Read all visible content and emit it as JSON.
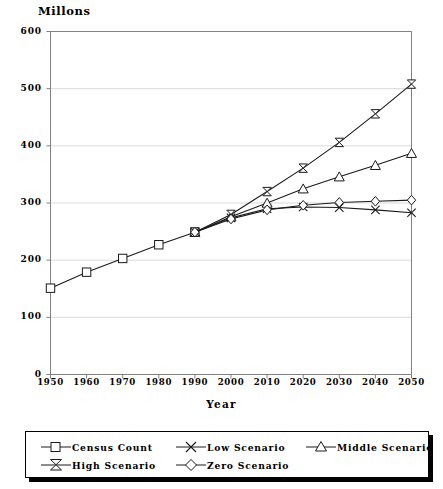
{
  "chart_data": {
    "type": "line",
    "title": "",
    "xlabel": "Year",
    "ylabel": "Millons",
    "xlim": [
      1950,
      2050
    ],
    "ylim": [
      0,
      600
    ],
    "ytick_step": 100,
    "xtick_step": 10,
    "grid": true,
    "legend_position": "below-plot",
    "x": [
      1950,
      1960,
      1970,
      1980,
      1990,
      2000,
      2010,
      2020,
      2030,
      2040,
      2050
    ],
    "xticklabels": [
      "1950",
      "1960",
      "1970",
      "1980",
      "1990",
      "2000",
      "2010",
      "2020",
      "2030",
      "2040",
      "2050"
    ],
    "yticklabels": [
      "0",
      "100",
      "200",
      "300",
      "400",
      "500",
      "600"
    ],
    "yticks": [
      0,
      100,
      200,
      300,
      400,
      500,
      600
    ],
    "series": [
      {
        "name": "Census Count",
        "marker": "square",
        "x": [
          1950,
          1960,
          1970,
          1980,
          1990
        ],
        "values": [
          151,
          179,
          203,
          227,
          249
        ]
      },
      {
        "name": "Low Scenario",
        "marker": "x",
        "x": [
          1990,
          2000,
          2010,
          2020,
          2030,
          2040,
          2050
        ],
        "values": [
          249,
          274,
          290,
          293,
          292,
          288,
          283
        ]
      },
      {
        "name": "Middle Scenario",
        "marker": "triangle",
        "x": [
          1990,
          2000,
          2010,
          2020,
          2030,
          2040,
          2050
        ],
        "values": [
          249,
          276,
          300,
          325,
          346,
          366,
          387
        ]
      },
      {
        "name": "High Scenario",
        "marker": "bowtie",
        "x": [
          1990,
          2000,
          2010,
          2020,
          2030,
          2040,
          2050
        ],
        "values": [
          249,
          280,
          320,
          361,
          406,
          456,
          508
        ]
      },
      {
        "name": "Zero Scenario",
        "marker": "diamond",
        "x": [
          1990,
          2000,
          2010,
          2020,
          2030,
          2040,
          2050
        ],
        "values": [
          249,
          272,
          288,
          296,
          301,
          303,
          305
        ]
      }
    ]
  },
  "legend": {
    "entries": [
      {
        "label": "Census Count",
        "marker": "square"
      },
      {
        "label": "Low Scenario",
        "marker": "x"
      },
      {
        "label": "Middle Scenario",
        "marker": "triangle"
      },
      {
        "label": "High Scenario",
        "marker": "bowtie"
      },
      {
        "label": "Zero Scenario",
        "marker": "diamond"
      }
    ]
  },
  "colors": {
    "line": "#1a1a1a",
    "grid": "#d9d9d9",
    "axis": "#808080",
    "text": "#000000",
    "background": "#ffffff"
  }
}
